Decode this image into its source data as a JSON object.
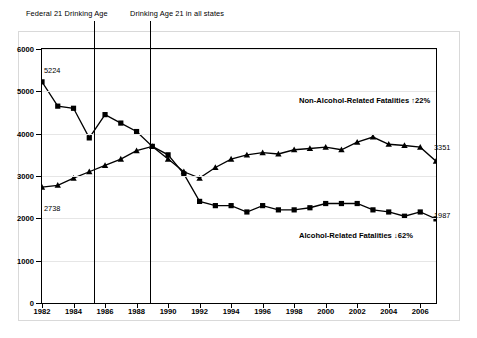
{
  "chart_data": {
    "type": "line",
    "title": "",
    "xlabel": "",
    "ylabel": "",
    "xlim": [
      1982,
      2007
    ],
    "ylim": [
      0,
      6000
    ],
    "ytick_values": [
      0,
      1000,
      2000,
      3000,
      4000,
      5000,
      6000
    ],
    "ytick_labels": [
      "0",
      "1000",
      "2000",
      "3000",
      "4000",
      "5000",
      "6000"
    ],
    "xtick_values": [
      1982,
      1984,
      1986,
      1988,
      1990,
      1992,
      1994,
      1996,
      1998,
      2000,
      2002,
      2004,
      2006
    ],
    "xtick_labels": [
      "1982",
      "1984",
      "1986",
      "1988",
      "1990",
      "1992",
      "1994",
      "1996",
      "1998",
      "2000",
      "2002",
      "2004",
      "2006"
    ],
    "grid": true,
    "legend_position": "inline-annotation",
    "x": [
      1982,
      1983,
      1984,
      1985,
      1986,
      1987,
      1988,
      1989,
      1990,
      1991,
      1992,
      1993,
      1994,
      1995,
      1996,
      1997,
      1998,
      1999,
      2000,
      2001,
      2002,
      2003,
      2004,
      2005,
      2006,
      2007
    ],
    "series": [
      {
        "name": "Alcohol-Related Fatalities",
        "marker": "square",
        "values": [
          5224,
          4650,
          4600,
          3900,
          4450,
          4250,
          4050,
          3700,
          3500,
          3050,
          2400,
          2300,
          2300,
          2150,
          2300,
          2200,
          2200,
          2250,
          2350,
          2350,
          2350,
          2200,
          2150,
          2050,
          2150,
          1987
        ]
      },
      {
        "name": "Non-Alcohol-Related Fatalities",
        "marker": "triangle",
        "values": [
          2738,
          2780,
          2950,
          3100,
          3250,
          3400,
          3600,
          3700,
          3400,
          3100,
          2950,
          3200,
          3400,
          3500,
          3550,
          3520,
          3620,
          3650,
          3680,
          3620,
          3800,
          3920,
          3750,
          3720,
          3680,
          3351
        ]
      }
    ],
    "annotations": {
      "events": [
        {
          "label": "Federal 21 Drinking Age",
          "x": 1984
        },
        {
          "label": "Drinking Age 21 in all states",
          "x": 1988
        }
      ],
      "series_labels": [
        {
          "text": "Non-Alcohol-Related Fatalities  ↑22%"
        },
        {
          "text": "Alcohol-Related Fatalities  ↓62%"
        }
      ],
      "point_labels": [
        {
          "text": "5224",
          "series": "Alcohol-Related Fatalities",
          "x": 1982
        },
        {
          "text": "2738",
          "series": "Non-Alcohol-Related Fatalities",
          "x": 1982
        },
        {
          "text": "3351",
          "series": "Non-Alcohol-Related Fatalities",
          "x": 2007
        },
        {
          "text": "1987",
          "series": "Alcohol-Related Fatalities",
          "x": 2007
        }
      ]
    }
  }
}
